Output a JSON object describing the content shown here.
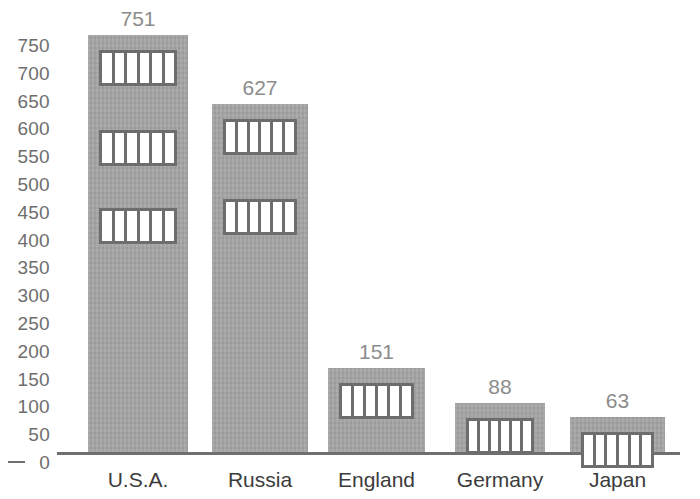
{
  "chart_data": {
    "type": "bar",
    "title": "",
    "subtitle": "",
    "xlabel": "",
    "ylabel": "",
    "categories": [
      "U.S.A.",
      "Russia",
      "England",
      "Germany",
      "Japan"
    ],
    "values": [
      751,
      627,
      151,
      88,
      63
    ],
    "value_labels": [
      "751",
      "627",
      "151",
      "88",
      "63"
    ],
    "ylim": [
      0,
      750
    ],
    "ytick_step": 50,
    "ytick_labels": [
      "750",
      "700",
      "650",
      "600",
      "550",
      "500",
      "450",
      "400",
      "350",
      "300",
      "250",
      "200",
      "150",
      "100",
      "50",
      "0"
    ],
    "ytick_values": [
      750,
      700,
      650,
      600,
      550,
      500,
      450,
      400,
      350,
      300,
      250,
      200,
      150,
      100,
      50,
      0
    ],
    "grid": false,
    "legend": null,
    "legend_position": "none",
    "bar_motif": "prison-window",
    "panes_per_window": 6,
    "windows_per_bar": [
      3,
      2,
      1,
      1,
      1
    ],
    "colors": {
      "bar_fill": "#a3a3a3",
      "window_frame": "#6d6d6d",
      "window_pane": "#ffffff",
      "value_label": "#8c8c8c",
      "tick_label": "#6e6e6e",
      "category_label": "#3c3c3c",
      "axis_line": "#6f6f6f",
      "background": "#ffffff"
    }
  },
  "geometry": {
    "baseline_y": 452,
    "axis_left_x": 57,
    "axis_right_x": 680,
    "px_per_unit": 0.5553,
    "tick_top_y": 45,
    "tick_spacing_y": 27.8,
    "bars": [
      {
        "x": 88,
        "width": 100
      },
      {
        "x": 212,
        "width": 96
      },
      {
        "x": 328,
        "width": 97
      },
      {
        "x": 455,
        "width": 90
      },
      {
        "x": 570,
        "width": 95
      }
    ],
    "window_width": 78,
    "window_height": 36,
    "window_rows_from_top": [
      15,
      95,
      173
    ]
  }
}
